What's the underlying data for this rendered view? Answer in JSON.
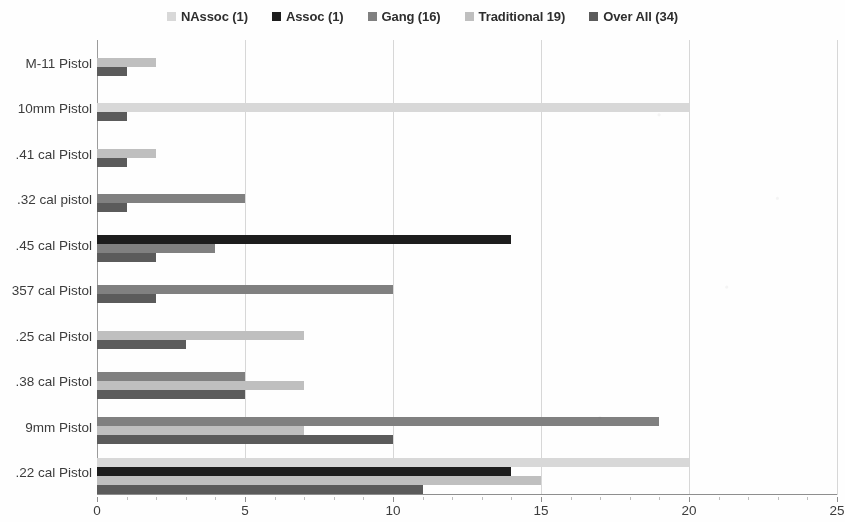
{
  "chart_data": {
    "type": "bar",
    "orientation": "horizontal",
    "title": "",
    "subtitle": "",
    "xlabel": "",
    "ylabel": "",
    "xlim": [
      0,
      25
    ],
    "xticks": [
      0,
      5,
      10,
      15,
      20,
      25
    ],
    "xtick_labels": [
      "0",
      "5",
      "10",
      "15",
      "20",
      "25"
    ],
    "grid": true,
    "grid_axis": "x",
    "legend_position": "top-center",
    "categories": [
      "M-11 Pistol",
      "10mm Pistol",
      ".41 cal Pistol",
      ".32 cal pistol",
      ".45 cal Pistol",
      "357 cal Pistol",
      ".25 cal Pistol",
      ".38 cal Pistol",
      "9mm Pistol",
      ".22 cal Pistol"
    ],
    "series": [
      {
        "name": "NAssoc (1)",
        "color": "#d9d9d9",
        "values": [
          0,
          20,
          0,
          0,
          0,
          0,
          0,
          0,
          0,
          20
        ]
      },
      {
        "name": "Assoc (1)",
        "color": "#1a1a1a",
        "values": [
          0,
          0,
          0,
          0,
          14,
          0,
          0,
          0,
          0,
          14
        ]
      },
      {
        "name": "Gang (16)",
        "color": "#7f7f7f",
        "values": [
          0,
          0,
          0,
          5,
          4,
          10,
          0,
          5,
          19,
          0
        ]
      },
      {
        "name": "Traditional 19)",
        "color": "#bfbfbf",
        "values": [
          2,
          0,
          2,
          0,
          0,
          0,
          7,
          7,
          7,
          15
        ]
      },
      {
        "name": "Over All (34)",
        "color": "#595959",
        "values": [
          1,
          1,
          1,
          1,
          2,
          2,
          3,
          5,
          10,
          11
        ]
      }
    ]
  },
  "legend": {
    "items": [
      {
        "label": "NAssoc (1)",
        "swatch_color": "#d9d9d9",
        "icon": "square-swatch-icon"
      },
      {
        "label": "Assoc (1)",
        "swatch_color": "#1a1a1a",
        "icon": "square-swatch-icon"
      },
      {
        "label": "Gang (16)",
        "swatch_color": "#7f7f7f",
        "icon": "square-swatch-icon"
      },
      {
        "label": "Traditional 19)",
        "swatch_color": "#bfbfbf",
        "icon": "square-swatch-icon"
      },
      {
        "label": "Over All (34)",
        "swatch_color": "#595959",
        "icon": "square-swatch-icon"
      }
    ]
  }
}
